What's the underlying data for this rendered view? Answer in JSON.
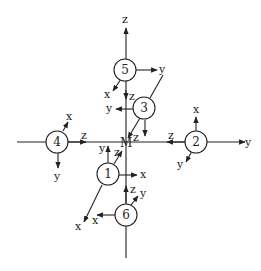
{
  "diagram": {
    "center": {
      "label": "M",
      "x": 126,
      "y": 142
    },
    "nodes": [
      {
        "id": "1",
        "label": "1",
        "x": 108,
        "y": 174
      },
      {
        "id": "2",
        "label": "2",
        "x": 196,
        "y": 142
      },
      {
        "id": "3",
        "label": "3",
        "x": 144,
        "y": 108
      },
      {
        "id": "4",
        "label": "4",
        "x": 57,
        "y": 142
      },
      {
        "id": "5",
        "label": "5",
        "x": 125,
        "y": 70
      },
      {
        "id": "6",
        "label": "6",
        "x": 126,
        "y": 215
      }
    ],
    "axis_labels": {
      "main_z": "z",
      "main_y": "y",
      "n5_y": "y",
      "n5_x": "x",
      "n5_z": "z",
      "n3_y": "y",
      "n3_z": "z",
      "n4_x": "x",
      "n4_y": "y",
      "n4_z": "z",
      "n2_x": "x",
      "n2_y": "y",
      "n2_z": "z",
      "n1_y": "y",
      "n1_z": "z",
      "n1_x": "x",
      "n1_x2": "x",
      "n6_z": "z",
      "n6_y": "y",
      "n6_x": "x"
    },
    "colors": {
      "stroke": "#222222",
      "background": "#ffffff"
    }
  }
}
